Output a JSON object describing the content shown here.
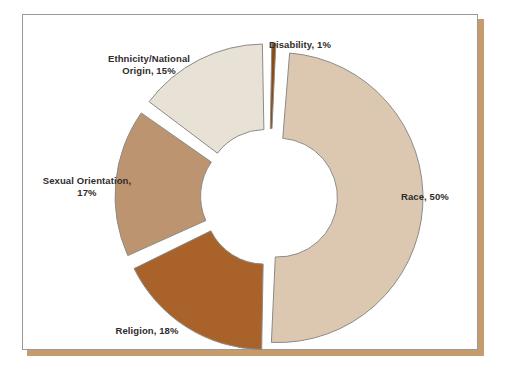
{
  "card": {
    "background_color": "#ffffff",
    "border_color": "#9a9a9a",
    "shadow_color": "#c69b6d"
  },
  "chart_data": {
    "type": "pie",
    "variant": "exploded-donut",
    "title": "",
    "subtitle": "",
    "xlabel": "",
    "ylabel": "",
    "legend_position": "none",
    "labels_outside": true,
    "inner_radius_ratio": 0.41,
    "total": 101,
    "units": "percent",
    "categories": [
      "Race",
      "Disability",
      "Ethnicity/National Origin",
      "Sexual Orientation",
      "Religion"
    ],
    "values": [
      50,
      1,
      15,
      17,
      18
    ],
    "colors": [
      "#dcc7b1",
      "#8a4a15",
      "#e8e1d5",
      "#bc9470",
      "#a9632a"
    ],
    "slices": [
      {
        "name": "Race",
        "value": 50,
        "label": "Race, 50%",
        "color": "#dcc7b1",
        "start_angle": 3.6,
        "end_angle": 183.6
      },
      {
        "name": "Disability",
        "value": 1,
        "label": "Disability, 1%",
        "color": "#8a4a15",
        "start_angle": 0.0,
        "end_angle": 3.6
      },
      {
        "name": "Ethnicity/National Origin",
        "value": 15,
        "label": "Ethnicity/National\nOrigin, 15%",
        "color": "#e8e1d5",
        "start_angle": 306.0,
        "end_angle": 360.0
      },
      {
        "name": "Sexual Orientation",
        "value": 17,
        "label": "Sexual Orientation,\n17%",
        "color": "#bc9470",
        "start_angle": 244.8,
        "end_angle": 306.0
      },
      {
        "name": "Religion",
        "value": 18,
        "label": "Religion, 18%",
        "color": "#a9632a",
        "start_angle": 180.0,
        "end_angle": 244.8
      }
    ]
  }
}
